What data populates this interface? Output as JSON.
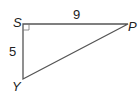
{
  "figure": {
    "type": "right-triangle",
    "vertices": {
      "S": {
        "label": "S",
        "x": 23,
        "y": 24
      },
      "P": {
        "label": "P",
        "x": 128,
        "y": 24
      },
      "Y": {
        "label": "Y",
        "x": 23,
        "y": 79
      }
    },
    "right_angle_at": "S",
    "side_labels": {
      "SP": "9",
      "SY": "5"
    },
    "stroke_color": "#555555"
  }
}
